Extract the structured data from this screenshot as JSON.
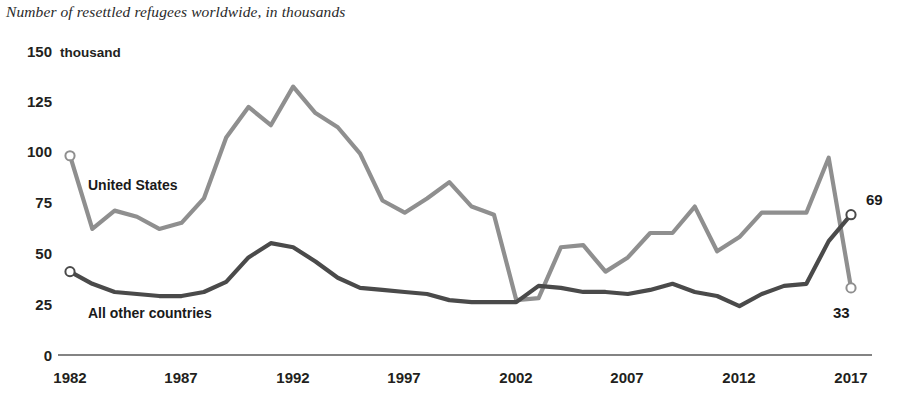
{
  "subtitle": "Number of resettled refugees worldwide, in thousands",
  "axis": {
    "y_unit": "thousand",
    "y_ticks": [
      "0",
      "25",
      "50",
      "75",
      "100",
      "125",
      "150"
    ],
    "x_ticks": [
      "1982",
      "1987",
      "1992",
      "1997",
      "2002",
      "2007",
      "2012",
      "2017"
    ]
  },
  "series_labels": {
    "us": "United States",
    "other": "All other countries"
  },
  "end_labels": {
    "other": "69",
    "us": "33"
  },
  "colors": {
    "us_line": "#8f8f8f",
    "other_line": "#4a4a4a",
    "axis": "#4a4a4a",
    "text": "#231f20"
  },
  "chart_data": {
    "type": "line",
    "title": "",
    "subtitle": "Number of resettled refugees worldwide, in thousands",
    "xlabel": "",
    "ylabel": "thousand",
    "xlim": [
      1982,
      2017
    ],
    "ylim": [
      0,
      150
    ],
    "grid": false,
    "legend": "inline-labels",
    "x": [
      1982,
      1983,
      1984,
      1985,
      1986,
      1987,
      1988,
      1989,
      1990,
      1991,
      1992,
      1993,
      1994,
      1995,
      1996,
      1997,
      1998,
      1999,
      2000,
      2001,
      2002,
      2003,
      2004,
      2005,
      2006,
      2007,
      2008,
      2009,
      2010,
      2011,
      2012,
      2013,
      2014,
      2015,
      2016,
      2017
    ],
    "series": [
      {
        "name": "United States",
        "color": "#8f8f8f",
        "end_value": 33,
        "values": [
          98,
          62,
          71,
          68,
          62,
          65,
          77,
          107,
          122,
          113,
          132,
          119,
          112,
          99,
          76,
          70,
          77,
          85,
          73,
          69,
          27,
          28,
          53,
          54,
          41,
          48,
          60,
          60,
          73,
          51,
          58,
          70,
          70,
          70,
          97,
          33
        ]
      },
      {
        "name": "All other countries",
        "color": "#4a4a4a",
        "end_value": 69,
        "values": [
          41,
          35,
          31,
          30,
          29,
          29,
          31,
          36,
          48,
          55,
          53,
          46,
          38,
          33,
          32,
          31,
          30,
          27,
          26,
          26,
          26,
          34,
          33,
          31,
          31,
          30,
          32,
          35,
          31,
          29,
          24,
          30,
          34,
          35,
          56,
          69
        ]
      }
    ],
    "annotations": [
      {
        "text": "United States",
        "series": "United States"
      },
      {
        "text": "All other countries",
        "series": "All other countries"
      },
      {
        "text": "69",
        "series": "All other countries",
        "x": 2017,
        "y": 69
      },
      {
        "text": "33",
        "series": "United States",
        "x": 2017,
        "y": 33
      }
    ]
  }
}
